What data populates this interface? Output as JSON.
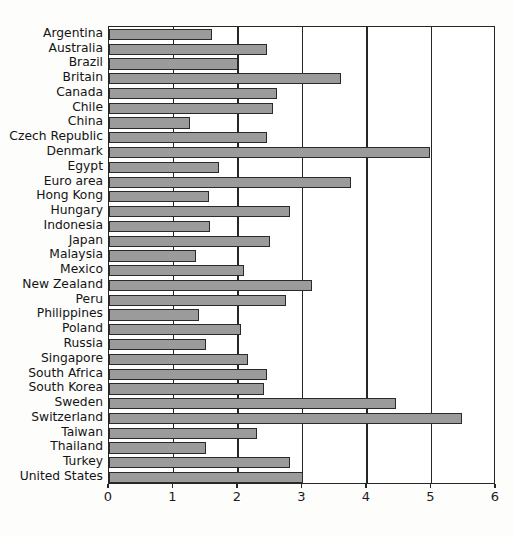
{
  "chart_data": {
    "type": "bar",
    "orientation": "horizontal",
    "title": "",
    "subtitle": "",
    "xlabel": "",
    "ylabel": "",
    "xlim": [
      0,
      6
    ],
    "ylim": null,
    "xticks": [
      0,
      1,
      2,
      3,
      4,
      5,
      6
    ],
    "xtick_labels": [
      "0",
      "1",
      "2",
      "3",
      "4",
      "5",
      "6"
    ],
    "grid": true,
    "grid_axis": "x",
    "legend": null,
    "legend_position": "none",
    "bar_color": "#9b9b9b",
    "bar_edge_color": "#2a2a2a",
    "axis_color": "#262626",
    "background_color": "#ffffff",
    "categories": [
      "Argentina",
      "Australia",
      "Brazil",
      "Britain",
      "Canada",
      "Chile",
      "China",
      "Czech Republic",
      "Denmark",
      "Egypt",
      "Euro area",
      "Hong Kong",
      "Hungary",
      "Indonesia",
      "Japan",
      "Malaysia",
      "Mexico",
      "New Zealand",
      "Peru",
      "Philippines",
      "Poland",
      "Russia",
      "Singapore",
      "South Africa",
      "South Korea",
      "Sweden",
      "Switzerland",
      "Taiwan",
      "Thailand",
      "Turkey",
      "United States"
    ],
    "values": [
      1.6,
      2.45,
      2.0,
      3.6,
      2.6,
      2.55,
      1.25,
      2.45,
      4.98,
      1.7,
      3.75,
      1.55,
      2.8,
      1.57,
      2.5,
      1.35,
      2.1,
      3.15,
      2.75,
      1.4,
      2.05,
      1.5,
      2.15,
      2.45,
      2.4,
      4.45,
      5.48,
      2.3,
      1.5,
      2.8,
      3.0
    ]
  }
}
